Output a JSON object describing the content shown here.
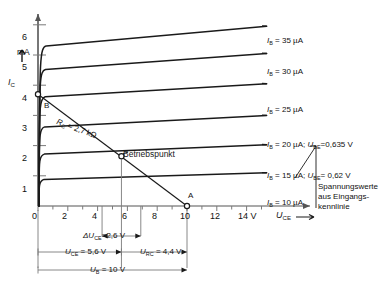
{
  "figure": {
    "kind": "transistor-output-characteristics",
    "language": "de"
  },
  "axes": {
    "x": {
      "label": "U",
      "label_sub": "CE",
      "unit": "V",
      "ticks": [
        0,
        2,
        4,
        6,
        8,
        10,
        12,
        14
      ],
      "tick_labels": [
        "0",
        "2",
        "4",
        "6",
        "8",
        "10",
        "12",
        "14 V"
      ],
      "min": 0,
      "max": 15.4,
      "minor_step": 1
    },
    "y": {
      "label": "I",
      "label_sub": "C",
      "unit": "mA",
      "ticks": [
        1,
        2,
        3,
        4,
        5,
        6
      ],
      "tick_labels": [
        "1",
        "2",
        "3",
        "4",
        "5",
        "6"
      ],
      "min": 0,
      "max": 6.5
    }
  },
  "chart_data": {
    "type": "line",
    "title": "",
    "xlabel": "U_CE (V)",
    "ylabel": "I_C (mA)",
    "xlim": [
      0,
      15.4
    ],
    "ylim": [
      0,
      6.5
    ],
    "grid": false,
    "series": [
      {
        "name": "I_B = 35 µA",
        "i_b_uA": 35,
        "knee_v": 0.55,
        "i_at_knee": 5.3,
        "i_at_end": 5.95,
        "label": "I",
        "label_sub": "B",
        "label_value": "35 µA"
      },
      {
        "name": "I_B = 30 µA",
        "i_b_uA": 30,
        "knee_v": 0.5,
        "i_at_knee": 4.52,
        "i_at_end": 5.05,
        "label": "I",
        "label_sub": "B",
        "label_value": "30 µA"
      },
      {
        "name": "I_B = 25 µA",
        "i_b_uA": 25,
        "knee_v": 0.48,
        "i_at_knee": 3.62,
        "i_at_end": 4.05,
        "label": "I",
        "label_sub": "B",
        "label_value": "25 µA"
      },
      {
        "name": "I_B = 20 µA",
        "i_b_uA": 20,
        "knee_v": 0.45,
        "i_at_knee": 2.62,
        "i_at_end": 3.0,
        "label": "I",
        "label_sub": "B",
        "label_value": "20 µA"
      },
      {
        "name": "I_B = 15 µA",
        "i_b_uA": 15,
        "knee_v": 0.42,
        "i_at_knee": 1.72,
        "i_at_end": 2.03,
        "label": "I",
        "label_sub": "B",
        "label_value": "15 µA"
      },
      {
        "name": "I_B = 10 µA",
        "i_b_uA": 10,
        "knee_v": 0.4,
        "i_at_knee": 0.88,
        "i_at_end": 1.1,
        "label": "I",
        "label_sub": "B",
        "label_value": "10 µA"
      }
    ],
    "load_line": {
      "name": "Arbeitsgerade",
      "from": {
        "u_ce": 0.0,
        "i_c": 3.7,
        "point": "B"
      },
      "to": {
        "u_ce": 10.0,
        "i_c": 0.0,
        "point": "A"
      },
      "resistor_label": "R",
      "resistor_label_sub": "C",
      "resistor_value": "= 2,7 kΩ"
    },
    "operating_point": {
      "label": "Betriebspunkt",
      "u_ce": 5.6,
      "i_c": 1.65
    }
  },
  "curve_annotations": [
    {
      "extra": ""
    },
    {
      "extra": ""
    },
    {
      "extra": ""
    },
    {
      "extra": "U",
      "extra_sub": "BE",
      "extra_value": "=0,635 V",
      "sep": ";"
    },
    {
      "extra": "U",
      "extra_sub": "BE",
      "extra_value": "= 0,62 V",
      "sep": ";"
    },
    {
      "extra": ""
    }
  ],
  "points": {
    "b": "B",
    "a": "A"
  },
  "side_note": {
    "line1": "Spannungswerte",
    "line2": "aus Eingangs-",
    "line3": "kennlinie"
  },
  "dimensions": [
    {
      "name": "delta-uce",
      "prefix": "ΔU",
      "sub": "CE",
      "value": "=2,6 V",
      "from_v": 4.3,
      "to_v": 6.9
    },
    {
      "name": "uce",
      "prefix": "U",
      "sub": "CE",
      "value": "= 5,6 V",
      "from_v": 0,
      "to_v": 5.6
    },
    {
      "name": "urc",
      "prefix": "U",
      "sub": "RC",
      "value": "= 4,4 V",
      "from_v": 5.6,
      "to_v": 10
    },
    {
      "name": "ub",
      "prefix": "U",
      "sub": "B",
      "value": "= 10 V",
      "from_v": 0,
      "to_v": 10
    }
  ],
  "colors": {
    "ink": "#1a1a1a",
    "curve": "#111111",
    "thin": "#7a7a7a",
    "axis": "#555555"
  }
}
